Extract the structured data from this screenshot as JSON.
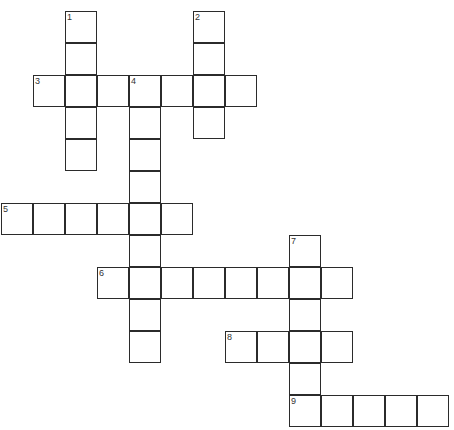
{
  "puzzle": {
    "cell_color": "#ffffff",
    "border_color": "#2b2b2b",
    "words": [
      {
        "number": "1",
        "direction": "down",
        "row": 0,
        "col": 2,
        "length": 5,
        "answer": ""
      },
      {
        "number": "2",
        "direction": "down",
        "row": 0,
        "col": 6,
        "length": 4,
        "answer": ""
      },
      {
        "number": "3",
        "direction": "across",
        "row": 2,
        "col": 1,
        "length": 7,
        "answer": ""
      },
      {
        "number": "4",
        "direction": "down",
        "row": 2,
        "col": 4,
        "length": 9,
        "answer": ""
      },
      {
        "number": "5",
        "direction": "across",
        "row": 6,
        "col": 0,
        "length": 6,
        "answer": ""
      },
      {
        "number": "6",
        "direction": "across",
        "row": 8,
        "col": 3,
        "length": 8,
        "answer": ""
      },
      {
        "number": "7",
        "direction": "down",
        "row": 7,
        "col": 9,
        "length": 6,
        "answer": ""
      },
      {
        "number": "8",
        "direction": "across",
        "row": 10,
        "col": 7,
        "length": 4,
        "answer": ""
      },
      {
        "number": "9",
        "direction": "across",
        "row": 12,
        "col": 9,
        "length": 5,
        "answer": ""
      }
    ]
  }
}
